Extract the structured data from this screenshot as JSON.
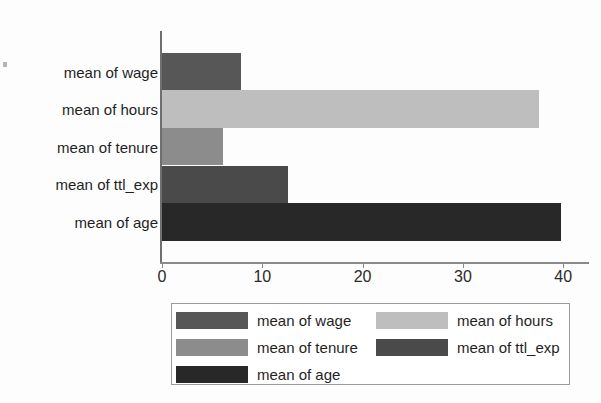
{
  "chart_data": {
    "type": "bar",
    "orientation": "horizontal",
    "title": "",
    "xlabel": "",
    "ylabel": "",
    "categories": [
      "mean of wage",
      "mean of hours",
      "mean of tenure",
      "mean of ttl_exp",
      "mean of age"
    ],
    "values": [
      7.9,
      37.6,
      6.1,
      12.6,
      39.8
    ],
    "xlim": [
      0,
      42.8
    ],
    "ylim": [
      0,
      5
    ],
    "xticks": [
      0,
      10,
      20,
      30,
      40
    ],
    "xtick_labels": [
      "0",
      "10",
      "20",
      "30",
      "40"
    ],
    "grid": false,
    "legend_position": "bottom",
    "series": [
      {
        "name": "mean of wage",
        "value": 7.9,
        "color": "#575757"
      },
      {
        "name": "mean of hours",
        "value": 37.6,
        "color": "#bebebe"
      },
      {
        "name": "mean of tenure",
        "value": 6.1,
        "color": "#8c8c8c"
      },
      {
        "name": "mean of ttl_exp",
        "value": 12.6,
        "color": "#4a4a4a"
      },
      {
        "name": "mean of age",
        "value": 39.8,
        "color": "#282828"
      }
    ]
  },
  "legend": {
    "entries": [
      {
        "label": "mean of wage",
        "color": "#575757"
      },
      {
        "label": "mean of hours",
        "color": "#bebebe"
      },
      {
        "label": "mean of tenure",
        "color": "#8c8c8c"
      },
      {
        "label": "mean of ttl_exp",
        "color": "#4a4a4a"
      },
      {
        "label": "mean of age",
        "color": "#282828"
      }
    ]
  },
  "axis": {
    "tick_labels": [
      "0",
      "10",
      "20",
      "30",
      "40"
    ]
  }
}
